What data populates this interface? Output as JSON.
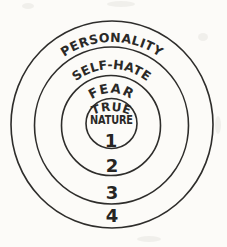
{
  "colors": {
    "ink": "#2e2d2b",
    "paper": "#fcfbf8"
  },
  "diagram": {
    "type": "concentric-circles",
    "rings": [
      {
        "number": "1",
        "label": "TRUE NATURE"
      },
      {
        "number": "2",
        "label": "FEAR"
      },
      {
        "number": "3",
        "label": "SELF-HATE"
      },
      {
        "number": "4",
        "label": "PERSONALITY"
      }
    ],
    "center": {
      "line1": "TRUE",
      "line2": "NATURE"
    }
  }
}
